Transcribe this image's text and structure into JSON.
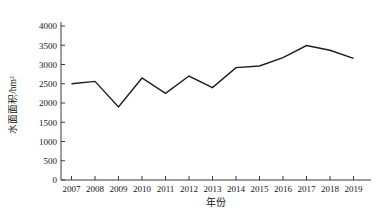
{
  "figure": {
    "background": "#ffffff",
    "line_color": "#1c1c1c",
    "axis_color": "#3a3a3a"
  },
  "chart_data": {
    "type": "line",
    "title": "",
    "xlabel": "年份",
    "ylabel": "水面面积/hm²",
    "x": [
      2007,
      2008,
      2009,
      2010,
      2011,
      2012,
      2013,
      2014,
      2015,
      2016,
      2017,
      2018,
      2019
    ],
    "values": [
      2500,
      2560,
      1900,
      2650,
      2250,
      2700,
      2400,
      2920,
      2960,
      3180,
      3490,
      3370,
      3160
    ],
    "ylim": [
      0,
      4000
    ],
    "y_ticks": [
      0,
      500,
      1000,
      1500,
      2000,
      2500,
      3000,
      3500,
      4000
    ],
    "x_ticks": [
      2007,
      2008,
      2009,
      2010,
      2011,
      2012,
      2013,
      2014,
      2015,
      2016,
      2017,
      2018,
      2019
    ],
    "grid": false,
    "legend": "none",
    "marker": "none"
  }
}
